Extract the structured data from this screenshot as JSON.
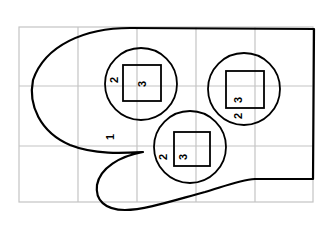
{
  "diagram": {
    "type": "mitten pattern on grid",
    "colors": {
      "outline": "#000000",
      "grid": "#c4c4c4",
      "background": "#ffffff"
    },
    "grid": {
      "columns": 5,
      "rows": 3
    },
    "labels": {
      "mitten": "1",
      "circles": [
        {
          "circle_label": "2",
          "square_label": "3"
        },
        {
          "circle_label": "2",
          "square_label": "3"
        },
        {
          "circle_label": "2",
          "square_label": "3"
        }
      ]
    }
  }
}
